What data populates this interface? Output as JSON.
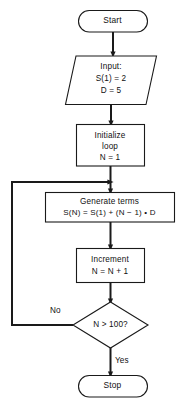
{
  "diagram": {
    "stroke_color": "#1a1a1a",
    "fill_color": "#ffffff",
    "text_color": "#111111",
    "nodes": {
      "start": {
        "label": "Start",
        "shape": "terminal"
      },
      "input": {
        "line1": "Input:",
        "line2": "S(1) = 2",
        "line3": "D = 5",
        "shape": "parallelogram"
      },
      "initialize": {
        "line1": "Initialize",
        "line2": "loop",
        "line3": "N = 1",
        "shape": "process"
      },
      "generate": {
        "line1": "Generate terms",
        "line2": "S(N) = S(1) + (N − 1) • D",
        "shape": "process"
      },
      "increment": {
        "line1": "Increment",
        "line2": "N = N + 1",
        "shape": "process"
      },
      "decision": {
        "label": "N > 100?",
        "shape": "decision"
      },
      "stop": {
        "label": "Stop",
        "shape": "terminal"
      }
    },
    "edge_labels": {
      "no": "No",
      "yes": "Yes"
    }
  }
}
